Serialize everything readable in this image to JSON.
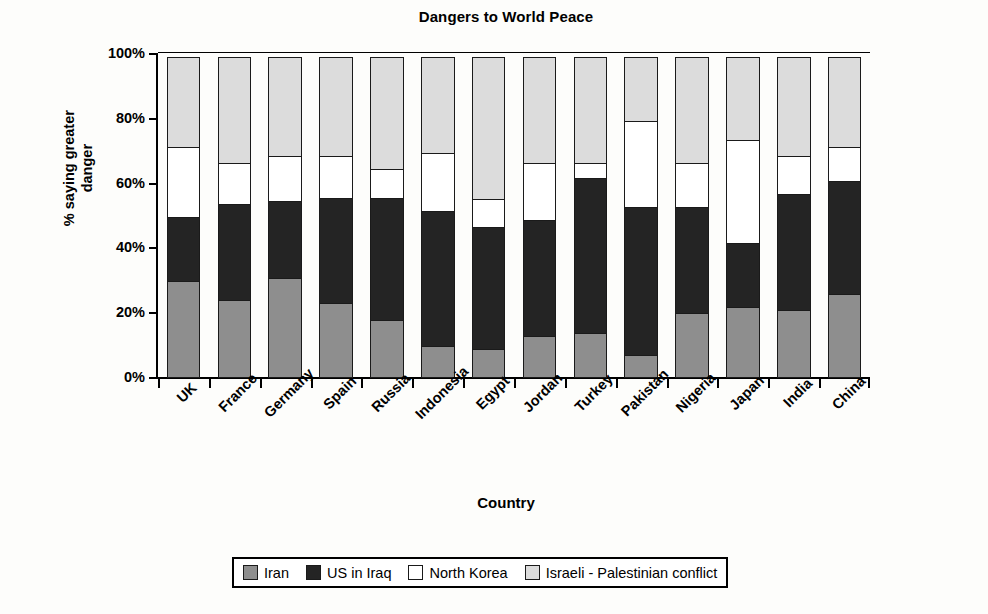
{
  "chart_data": {
    "type": "bar",
    "stacked": true,
    "stack_total": 100,
    "title": "Dangers to World Peace",
    "xlabel": "Country",
    "ylabel": "% saying greater danger",
    "ylabel_lines": [
      "% saying greater",
      "danger"
    ],
    "ylim": [
      0,
      100
    ],
    "yticks": [
      0,
      20,
      40,
      60,
      80,
      100
    ],
    "ytick_labels": [
      "0%",
      "20%",
      "40%",
      "60%",
      "80%",
      "100%"
    ],
    "grid": false,
    "legend_position": "bottom",
    "categories": [
      "UK",
      "France",
      "Germany",
      "Spain",
      "Russia",
      "Indonesia",
      "Egypt",
      "Jordan",
      "Turkey",
      "Pakistan",
      "Nigeria",
      "Japan",
      "India",
      "China"
    ],
    "series": [
      {
        "name": "Iran",
        "color": "#8e8e8e",
        "values": [
          30,
          24,
          31,
          23,
          18,
          10,
          9,
          13,
          14,
          7,
          20,
          22,
          21,
          26
        ]
      },
      {
        "name": "US in Iraq",
        "color": "#242424",
        "values": [
          20,
          30,
          24,
          33,
          38,
          42,
          38,
          36,
          48,
          46,
          33,
          20,
          36,
          35
        ]
      },
      {
        "name": "North Korea",
        "color": "#ffffff",
        "values": [
          22,
          13,
          14,
          13,
          9,
          18,
          9,
          18,
          5,
          27,
          14,
          32,
          12,
          11
        ]
      },
      {
        "name": "Israeli - Palestinian conflict",
        "color": "#dcdcdc",
        "values": [
          28,
          33,
          31,
          31,
          35,
          30,
          44,
          33,
          33,
          20,
          33,
          26,
          31,
          28
        ]
      }
    ]
  },
  "legend": {
    "items": [
      {
        "label": "Iran",
        "swatch": "#8e8e8e"
      },
      {
        "label": "US in Iraq",
        "swatch": "#242424"
      },
      {
        "label": "North Korea",
        "swatch": "#ffffff"
      },
      {
        "label": "Israeli - Palestinian conflict",
        "swatch": "#dcdcdc"
      }
    ]
  }
}
